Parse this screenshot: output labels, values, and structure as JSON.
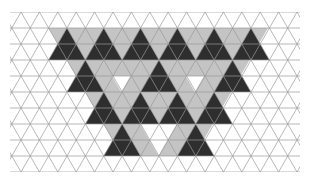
{
  "grid": {
    "x0": 2.6,
    "y0": 12,
    "side": 18.4,
    "row_height": 16,
    "rows": 10,
    "x_min": 10,
    "x_max": 300,
    "line_color": "#9a9a9a",
    "background": "#ffffff"
  },
  "colors": {
    "dark": "#2e2e2e",
    "light": "#c4c4c4",
    "lighter": "#d6d6d6"
  },
  "light_regions": [
    {
      "points": [
        [
          48.6,
          28
        ],
        [
          267.4,
          28
        ],
        [
          158,
          124
        ],
        [
          140,
          156
        ],
        [
          121.6,
          156
        ],
        [
          57.8,
          44
        ]
      ]
    }
  ],
  "light_polys": [
    [
      [
        48.6,
        28
      ],
      [
        268,
        28
      ],
      [
        231.2,
        92
      ],
      [
        194.4,
        156
      ],
      [
        121.6,
        156
      ],
      [
        85,
        92
      ]
    ]
  ],
  "white_cells": [
    [
      [
        112,
        76
      ],
      [
        130.4,
        76
      ],
      [
        121.2,
        92
      ]
    ],
    [
      [
        185.6,
        76
      ],
      [
        204,
        76
      ],
      [
        194.8,
        92
      ]
    ],
    [
      [
        140,
        124
      ],
      [
        176.8,
        124
      ],
      [
        158.4,
        156
      ]
    ],
    [
      [
        57.8,
        44
      ],
      [
        76.2,
        44
      ],
      [
        67,
        60
      ]
    ]
  ],
  "dark_triangles": [
    {
      "apex": [
        66.9,
        28
      ],
      "size": 2
    },
    {
      "apex": [
        103.7,
        28
      ],
      "size": 2
    },
    {
      "apex": [
        140.5,
        28
      ],
      "size": 2
    },
    {
      "apex": [
        177.3,
        28
      ],
      "size": 2
    },
    {
      "apex": [
        214.1,
        28
      ],
      "size": 2
    },
    {
      "apex": [
        250.9,
        28
      ],
      "size": 2
    },
    {
      "apex": [
        85.3,
        60
      ],
      "size": 2
    },
    {
      "apex": [
        158.9,
        60
      ],
      "size": 2
    },
    {
      "apex": [
        232.5,
        60
      ],
      "size": 2
    },
    {
      "apex": [
        103.7,
        92
      ],
      "size": 2
    },
    {
      "apex": [
        140.5,
        92
      ],
      "size": 2
    },
    {
      "apex": [
        177.3,
        92
      ],
      "size": 2
    },
    {
      "apex": [
        214.1,
        92
      ],
      "size": 2
    },
    {
      "apex": [
        122.1,
        124
      ],
      "size": 2
    },
    {
      "apex": [
        195.7,
        124
      ],
      "size": 2
    }
  ]
}
